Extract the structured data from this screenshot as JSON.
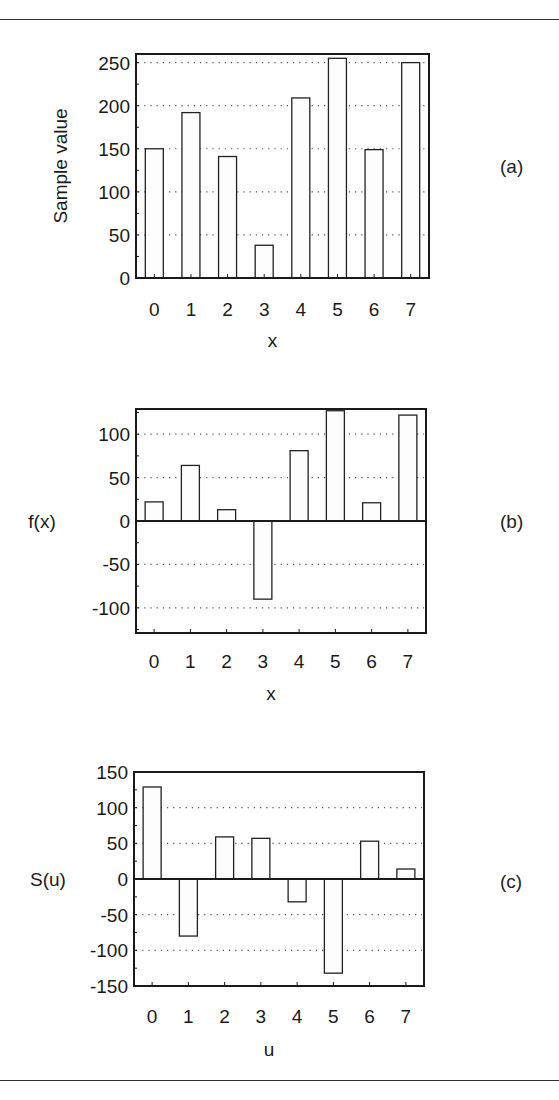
{
  "figure": {
    "panels": [
      "(a)",
      "(b)",
      "(c)"
    ]
  },
  "chart_data": [
    {
      "type": "bar",
      "panel_label": "(a)",
      "title": "",
      "xlabel": "x",
      "ylabel": "Sample value",
      "categories": [
        "0",
        "1",
        "2",
        "3",
        "4",
        "5",
        "6",
        "7"
      ],
      "values": [
        150,
        192,
        141,
        38,
        209,
        255,
        149,
        250
      ],
      "ylim": [
        0,
        260
      ],
      "yticks": [
        0,
        50,
        100,
        150,
        200,
        250
      ],
      "grid": "horizontal dotted",
      "legend": null,
      "layout": {
        "left": 136,
        "right": 429,
        "top": 54,
        "bottom": 278,
        "tick_label_y": 309,
        "xlabel_y": 340,
        "ylabel_x": 67,
        "panel_label_x": 500,
        "panel_label_y": 167
      }
    },
    {
      "type": "bar",
      "panel_label": "(b)",
      "title": "",
      "xlabel": "x",
      "ylabel": "f(x)",
      "categories": [
        "0",
        "1",
        "2",
        "3",
        "4",
        "5",
        "6",
        "7"
      ],
      "values": [
        22,
        64,
        13,
        -90,
        81,
        127,
        21,
        122
      ],
      "ylim": [
        -129,
        129
      ],
      "yticks": [
        -100,
        -50,
        0,
        50,
        100
      ],
      "grid": "horizontal dotted",
      "legend": null,
      "layout": {
        "left": 136,
        "right": 426,
        "top": 409,
        "bottom": 633,
        "tick_label_y": 661,
        "xlabel_y": 693,
        "ylabel_x": 42,
        "panel_label_x": 500,
        "panel_label_y": 522
      }
    },
    {
      "type": "bar",
      "panel_label": "(c)",
      "title": "",
      "xlabel": "u",
      "ylabel": "S(u)",
      "categories": [
        "0",
        "1",
        "2",
        "3",
        "4",
        "5",
        "6",
        "7"
      ],
      "values": [
        129,
        -80,
        59,
        57,
        -32,
        -132,
        53,
        14
      ],
      "ylim": [
        -150,
        150
      ],
      "yticks": [
        -150,
        -100,
        -50,
        0,
        50,
        100,
        150
      ],
      "grid": "horizontal dotted",
      "legend": null,
      "layout": {
        "left": 134,
        "right": 424,
        "top": 772,
        "bottom": 986,
        "tick_label_y": 1016,
        "xlabel_y": 1049,
        "ylabel_x": 48,
        "panel_label_x": 500,
        "panel_label_y": 882
      }
    }
  ],
  "style": {
    "frame_color": "#1a1a1a",
    "bar_fill": "#fdfdfd",
    "bar_stroke": "#222222",
    "grid_color": "#555555",
    "text_color": "#1a1a1a",
    "rule_color": "#333333"
  }
}
